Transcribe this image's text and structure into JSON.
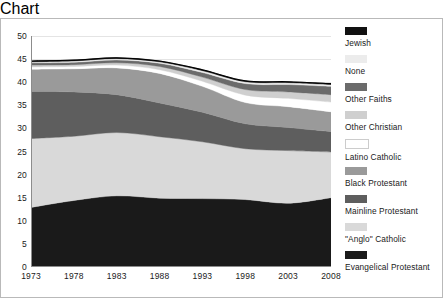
{
  "chart_data": {
    "type": "area",
    "stacked": true,
    "title": "",
    "xlabel": "",
    "ylabel": "",
    "x": [
      1973,
      1978,
      1983,
      1988,
      1993,
      1998,
      2003,
      2008
    ],
    "xtick_labels": [
      "1973",
      "1978",
      "1983",
      "1988",
      "1993",
      "1998",
      "2003",
      "2008"
    ],
    "xlim": [
      1973,
      2008
    ],
    "ylim": [
      0,
      50
    ],
    "ytick_labels": [
      "0",
      "5",
      "10",
      "15",
      "20",
      "25",
      "30",
      "35",
      "40",
      "45",
      "50"
    ],
    "yticks": [
      0,
      5,
      10,
      15,
      20,
      25,
      30,
      35,
      40,
      45,
      50
    ],
    "grid": true,
    "legend_position": "right",
    "stack_order_bottom_to_top": [
      "Evangelical Protestant",
      "\"Anglo\" Catholic",
      "Mainline Protestant",
      "Black Protestant",
      "Latino Catholic",
      "Other Christian",
      "Other Faiths",
      "None",
      "Jewish"
    ],
    "series": [
      {
        "name": "Evangelical Protestant",
        "color": "#1a1a1a",
        "values": [
          12.9,
          14.4,
          15.4,
          14.9,
          14.8,
          14.6,
          13.8,
          15.0
        ],
        "cumulative_top": [
          12.9,
          14.4,
          15.4,
          14.9,
          14.8,
          14.6,
          13.8,
          15.0
        ]
      },
      {
        "name": "\"Anglo\" Catholic",
        "color": "#d9d9d9",
        "values": [
          14.9,
          13.9,
          13.7,
          13.3,
          12.3,
          11.0,
          11.4,
          9.9
        ],
        "cumulative_top": [
          27.8,
          28.3,
          29.1,
          28.2,
          27.1,
          25.6,
          25.2,
          24.9
        ]
      },
      {
        "name": "Mainline Protestant",
        "color": "#5e5e5e",
        "values": [
          10.2,
          9.6,
          8.2,
          7.3,
          6.4,
          5.4,
          5.0,
          4.4
        ],
        "cumulative_top": [
          38.0,
          37.9,
          37.3,
          35.5,
          33.5,
          31.0,
          30.2,
          29.3
        ]
      },
      {
        "name": "Black Protestant",
        "color": "#9a9a9a",
        "values": [
          4.8,
          5.0,
          5.8,
          6.4,
          5.6,
          4.6,
          4.5,
          4.3
        ],
        "cumulative_top": [
          42.8,
          42.9,
          43.1,
          41.9,
          39.1,
          35.6,
          34.7,
          33.6
        ]
      },
      {
        "name": "Latino Catholic",
        "color": "#ffffff",
        "values": [
          0.5,
          0.5,
          0.6,
          0.8,
          1.1,
          1.6,
          1.8,
          2.1
        ],
        "cumulative_top": [
          43.3,
          43.4,
          43.7,
          42.7,
          40.2,
          37.2,
          36.5,
          35.7
        ]
      },
      {
        "name": "Other Christian",
        "color": "#cfcfcf",
        "values": [
          0.4,
          0.4,
          0.5,
          0.7,
          0.9,
          1.2,
          1.4,
          1.6
        ],
        "cumulative_top": [
          43.7,
          43.8,
          44.2,
          43.4,
          41.1,
          38.4,
          37.9,
          37.3
        ]
      },
      {
        "name": "Other Faiths",
        "color": "#6b6b6b",
        "values": [
          0.5,
          0.5,
          0.6,
          0.7,
          1.0,
          1.3,
          1.6,
          1.8
        ],
        "cumulative_top": [
          44.2,
          44.3,
          44.8,
          44.1,
          42.1,
          39.7,
          39.5,
          39.1
        ]
      },
      {
        "name": "None",
        "color": "#ececec",
        "values": [
          0.2,
          0.3,
          0.3,
          0.3,
          0.4,
          0.4,
          0.4,
          0.4
        ],
        "cumulative_top": [
          44.4,
          44.6,
          45.1,
          44.4,
          42.5,
          40.1,
          39.9,
          39.5
        ]
      },
      {
        "name": "Jewish",
        "color": "#111111",
        "values": [
          0.2,
          0.2,
          0.2,
          0.2,
          0.2,
          0.2,
          0.2,
          0.2
        ],
        "cumulative_top": [
          44.6,
          44.8,
          45.3,
          44.6,
          42.7,
          40.3,
          40.1,
          39.7
        ]
      }
    ]
  },
  "legend": {
    "items": [
      {
        "label": "Jewish",
        "color": "#111111"
      },
      {
        "label": "None",
        "color": "#ececec"
      },
      {
        "label": "Other Faiths",
        "color": "#6b6b6b"
      },
      {
        "label": "Other Christian",
        "color": "#cfcfcf"
      },
      {
        "label": "Latino Catholic",
        "color": "#ffffff"
      },
      {
        "label": "Black Protestant",
        "color": "#9a9a9a"
      },
      {
        "label": "Mainline Protestant",
        "color": "#5e5e5e"
      },
      {
        "label": "\"Anglo\" Catholic",
        "color": "#d9d9d9"
      },
      {
        "label": "Evangelical Protestant",
        "color": "#1a1a1a"
      }
    ]
  }
}
